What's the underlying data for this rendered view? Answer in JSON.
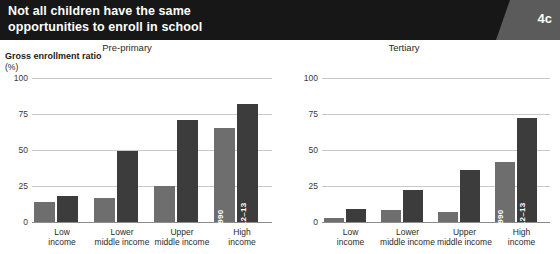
{
  "header": {
    "title_line1": "Not all children have the same",
    "title_line2": "opportunities to enroll in school",
    "badge": "4c"
  },
  "axis": {
    "label": "Gross enrollment ratio",
    "unit": "(%)"
  },
  "series_labels": {
    "old": "1990",
    "recent": "2012–13"
  },
  "colors": {
    "header_bg": "#171717",
    "badge_bg": "#5b5b5b",
    "bar_1990": "#6e6e6e",
    "bar_2012_13": "#3c3c3c",
    "gridline": "#c9c9c9"
  },
  "chart_data": [
    {
      "type": "bar",
      "title": "Pre-primary",
      "xlabel": "",
      "ylabel": "Gross enrollment ratio (%)",
      "ylim": [
        0,
        100
      ],
      "yticks": [
        0,
        25,
        50,
        75,
        100
      ],
      "ytick_labels": [
        "0",
        "25",
        "50",
        "75",
        "100"
      ],
      "grid": true,
      "legend": "in-bar",
      "categories": [
        "Low income",
        "Lower middle income",
        "Upper middle income",
        "High income"
      ],
      "category_lines": [
        [
          "Low",
          "income"
        ],
        [
          "Lower",
          "middle income"
        ],
        [
          "Upper",
          "middle income"
        ],
        [
          "High",
          "income"
        ]
      ],
      "series": [
        {
          "name": "1990",
          "values": [
            14,
            17,
            25,
            65
          ]
        },
        {
          "name": "2012–13",
          "values": [
            18,
            49,
            71,
            82
          ]
        }
      ]
    },
    {
      "type": "bar",
      "title": "Tertiary",
      "xlabel": "",
      "ylabel": "Gross enrollment ratio (%)",
      "ylim": [
        0,
        100
      ],
      "yticks": [
        0,
        25,
        50,
        75,
        100
      ],
      "ytick_labels": [
        "0",
        "25",
        "50",
        "75",
        "100"
      ],
      "grid": true,
      "legend": "in-bar",
      "categories": [
        "Low income",
        "Lower middle income",
        "Upper middle income",
        "High income"
      ],
      "category_lines": [
        [
          "Low",
          "income"
        ],
        [
          "Lower",
          "middle income"
        ],
        [
          "Upper",
          "middle income"
        ],
        [
          "High",
          "income"
        ]
      ],
      "series": [
        {
          "name": "1990",
          "values": [
            3,
            8,
            7,
            42
          ]
        },
        {
          "name": "2012–13",
          "values": [
            9,
            22,
            36,
            72
          ]
        }
      ]
    }
  ]
}
